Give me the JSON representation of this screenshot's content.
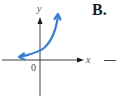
{
  "panel": {
    "label": "B."
  },
  "axes": {
    "x_label": "x",
    "y_label": "y",
    "origin_label": "0"
  },
  "curve": {
    "description": "increasing exponential-like curve approaching x-axis on the left, rising steeply on the right, arrows on both ends",
    "color": "#3a7fd0"
  },
  "colors": {
    "axis": "#2a2a2a",
    "curve": "#3a7fd0",
    "background": "#ffffff"
  }
}
